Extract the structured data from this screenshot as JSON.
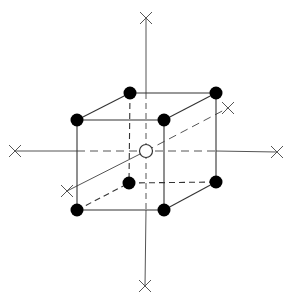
{
  "diagram": {
    "type": "crystal-unit-cell",
    "colors": {
      "background": "#ffffff",
      "line": "#333333",
      "axis": "#555555",
      "atom_filled": "#000000",
      "atom_center_fill": "#ffffff",
      "atom_center_stroke": "#333333"
    },
    "axes": [
      {
        "name": "vertical-axis",
        "from": [
          146,
          18
        ],
        "to": [
          145,
          286
        ]
      },
      {
        "name": "horizontal-axis",
        "from": [
          15,
          151
        ],
        "to": [
          277,
          152
        ]
      },
      {
        "name": "depth-axis",
        "from": [
          67,
          191
        ],
        "to": [
          228,
          108
        ]
      }
    ],
    "axis_end_markers": [
      {
        "name": "top",
        "x": 146,
        "y": 18
      },
      {
        "name": "bottom",
        "x": 145,
        "y": 286
      },
      {
        "name": "left",
        "x": 15,
        "y": 151
      },
      {
        "name": "right",
        "x": 277,
        "y": 152
      },
      {
        "name": "depth-back",
        "x": 228,
        "y": 108
      },
      {
        "name": "depth-front",
        "x": 67,
        "y": 191
      }
    ],
    "corner_atoms": [
      {
        "name": "front-top-left",
        "x": 77,
        "y": 120
      },
      {
        "name": "front-top-right",
        "x": 164,
        "y": 120
      },
      {
        "name": "back-top-left",
        "x": 130,
        "y": 93
      },
      {
        "name": "back-top-right",
        "x": 216,
        "y": 93
      },
      {
        "name": "front-bottom-left",
        "x": 77,
        "y": 210
      },
      {
        "name": "front-bottom-right",
        "x": 164,
        "y": 210
      },
      {
        "name": "back-bottom-left",
        "x": 129,
        "y": 183
      },
      {
        "name": "back-bottom-right",
        "x": 216,
        "y": 182
      }
    ],
    "center_atom": {
      "name": "body-center",
      "x": 146,
      "y": 151,
      "filled": false
    },
    "atom_count": {
      "corner": 8,
      "body_center": 1
    }
  }
}
